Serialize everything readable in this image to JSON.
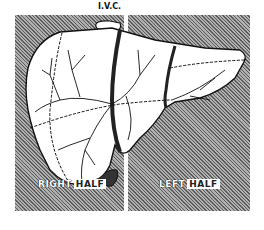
{
  "figure": {
    "labels": {
      "ivc": "I.V.C.",
      "right_word1": "RIGHT",
      "right_word2": "HALF",
      "left_word1": "LEFT",
      "left_word2": "HALF"
    },
    "colors": {
      "background": "#ffffff",
      "hatch_dark": "#5c5c5c",
      "hatch_light": "#b0b0b0",
      "liver_fill": "#ffffff",
      "outline": "#111111"
    }
  }
}
